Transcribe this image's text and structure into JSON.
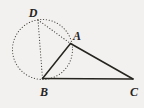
{
  "figure": {
    "background_color": "#f3f1ef",
    "stroke_color": "#26241f",
    "dotted_color": "#4a4844",
    "labels": [
      {
        "id": "D",
        "text": "D",
        "x": 33,
        "y": 13
      },
      {
        "id": "A",
        "text": "A",
        "x": 77,
        "y": 36
      },
      {
        "id": "B",
        "text": "B",
        "x": 44,
        "y": 92
      },
      {
        "id": "C",
        "text": "C",
        "x": 134,
        "y": 92
      }
    ],
    "points": [
      {
        "id": "A",
        "x": 70.5,
        "y": 43.5
      },
      {
        "id": "B",
        "x": 42.5,
        "y": 78.5
      },
      {
        "id": "C",
        "x": 133.0,
        "y": 79.0
      },
      {
        "id": "D",
        "x": 38.0,
        "y": 20.0
      }
    ],
    "circle": {
      "cx": 42.5,
      "cy": 49.5,
      "r": 30.0,
      "style": "dotted"
    },
    "solid_segments": [
      {
        "id": "AB",
        "from": "A",
        "to": "B"
      },
      {
        "id": "AC",
        "from": "A",
        "to": "C"
      },
      {
        "id": "BC",
        "from": "B",
        "to": "C"
      }
    ],
    "dotted_segments": [
      {
        "id": "DB",
        "from": "D",
        "to": "B"
      },
      {
        "id": "DA",
        "from": "D",
        "to": "A"
      }
    ]
  }
}
